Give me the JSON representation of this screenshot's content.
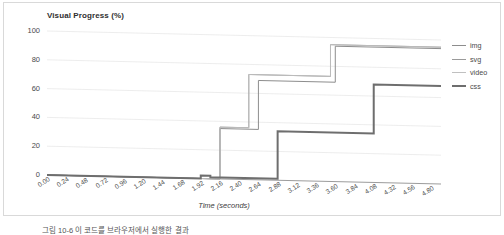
{
  "chart_data": {
    "type": "line",
    "subtype": "step",
    "title": "Visual Progress (%)",
    "xlabel": "Time (seconds)",
    "ylabel": "",
    "xlim": [
      0.0,
      4.92
    ],
    "ylim": [
      0,
      100
    ],
    "grid": true,
    "legend_position": "right",
    "y_ticks": [
      0,
      20,
      40,
      60,
      80,
      100
    ],
    "x_ticks": [
      "0.00",
      "0.24",
      "0.48",
      "0.72",
      "0.96",
      "1.20",
      "1.44",
      "1.68",
      "1.92",
      "2.16",
      "2.40",
      "2.64",
      "2.88",
      "3.12",
      "3.36",
      "3.60",
      "3.84",
      "4.08",
      "4.32",
      "4.56",
      "4.80"
    ],
    "x_tick_values": [
      0.0,
      0.24,
      0.48,
      0.72,
      0.96,
      1.2,
      1.44,
      1.68,
      1.92,
      2.16,
      2.4,
      2.64,
      2.88,
      3.12,
      3.36,
      3.6,
      3.84,
      4.08,
      4.32,
      4.56,
      4.8
    ],
    "series": [
      {
        "name": "img",
        "color": "#8d8d8d",
        "width": 1.0,
        "x": [
          0.0,
          2.16,
          2.64,
          3.6,
          4.92
        ],
        "values": [
          0,
          35,
          69,
          94,
          94
        ]
      },
      {
        "name": "svg",
        "color": "#9a9a9a",
        "width": 1.0,
        "x": [
          0.0,
          2.16,
          2.52,
          3.54,
          4.92
        ],
        "values": [
          0,
          36,
          73,
          95,
          95
        ]
      },
      {
        "name": "video",
        "color": "#c0c0c0",
        "width": 0.9,
        "x": [
          0.0,
          2.16,
          2.52,
          3.54,
          4.92
        ],
        "values": [
          0,
          36,
          73,
          95,
          95
        ]
      },
      {
        "name": "css",
        "color": "#6e6e6e",
        "width": 2.0,
        "x": [
          0.0,
          1.92,
          2.04,
          2.88,
          4.08,
          4.92
        ],
        "values": [
          0,
          2,
          1,
          34,
          68,
          68
        ]
      }
    ]
  },
  "legend": {
    "items": [
      {
        "label": "img"
      },
      {
        "label": "svg"
      },
      {
        "label": "video"
      },
      {
        "label": "css"
      }
    ]
  },
  "caption": {
    "text": "그림 10-6 이 코드를 브라우저에서 실행한 결과"
  }
}
